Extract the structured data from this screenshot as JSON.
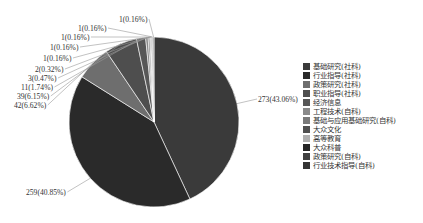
{
  "chart_data": {
    "type": "pie",
    "title": "",
    "total": 634,
    "start_angle_deg": 0,
    "direction": "clockwise",
    "legend_position": "right",
    "slices": [
      {
        "category": "基础研究(社科)",
        "value": 273,
        "percent": "43.06%",
        "label": "273(43.06%)",
        "color": "#3a3a3a"
      },
      {
        "category": "行业指导(社科)",
        "value": 259,
        "percent": "40.85%",
        "label": "259(40.85%)",
        "color": "#2a2a2a"
      },
      {
        "category": "政策研究(社科)",
        "value": 42,
        "percent": "6.62%",
        "label": "42(6.62%)",
        "color": "#6e6e6e"
      },
      {
        "category": "职业指导(社科)",
        "value": 39,
        "percent": "6.15%",
        "label": "39(6.15%)",
        "color": "#4e4e4e"
      },
      {
        "category": "经济信息",
        "value": 11,
        "percent": "1.74%",
        "label": "11(1.74%)",
        "color": "#575757"
      },
      {
        "category": "工程技术(自科)",
        "value": 3,
        "percent": "0.47%",
        "label": "3(0.47%)",
        "color": "#8a8a8a"
      },
      {
        "category": "基础与应用基础研究(自科)",
        "value": 2,
        "percent": "0.32%",
        "label": "2(0.32%)",
        "color": "#7a7a7a"
      },
      {
        "category": "大众文化",
        "value": 1,
        "percent": "0.16%",
        "label": "1(0.16%)",
        "color": "#505050"
      },
      {
        "category": "高等教育",
        "value": 1,
        "percent": "0.16%",
        "label": "1(0.16%)",
        "color": "#b0b0b0"
      },
      {
        "category": "大众科普",
        "value": 1,
        "percent": "0.16%",
        "label": "1(0.16%)",
        "color": "#262626"
      },
      {
        "category": "政策研究(自科)",
        "value": 1,
        "percent": "0.16%",
        "label": "1(0.16%)",
        "color": "#404040"
      },
      {
        "category": "行业技术指导(自科)",
        "value": 1,
        "percent": "0.16%",
        "label": "1(0.16%)",
        "color": "#353535"
      }
    ]
  },
  "legend": {
    "items": [
      "基础研究(社科)",
      "行业指导(社科)",
      "政策研究(社科)",
      "职业指导(社科)",
      "经济信息",
      "工程技术(自科)",
      "基础与应用基础研究(自科)",
      "大众文化",
      "高等教育",
      "大众科普",
      "政策研究(自科)",
      "行业技术指导(自科)"
    ]
  },
  "labels": {
    "l0": "273(43.06%)",
    "l1": "259(40.85%)",
    "l2": "42(6.62%)",
    "l3": "39(6.15%)",
    "l4": "11(1.74%)",
    "l5": "3(0.47%)",
    "l6": "2(0.32%)",
    "l7": "1(0.16%)",
    "l8": "1(0.16%)",
    "l9": "1(0.16%)",
    "l10": "1(0.16%)",
    "l11": "1(0.16%)"
  }
}
